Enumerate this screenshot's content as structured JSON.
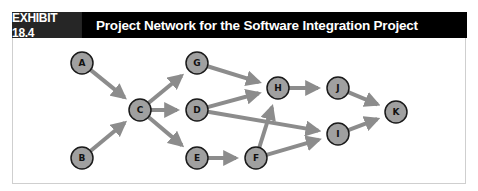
{
  "header": {
    "exhibit_label": "EXHIBIT 18.4",
    "title": "Project Network for the Software Integration Project"
  },
  "colors": {
    "header_bg": "#000000",
    "exhibit_bg": "#262626",
    "node_fill": "#a0a0a0",
    "node_stroke": "#1a1a1a",
    "arrow": "#8c8c8c"
  },
  "diagram": {
    "type": "activity-on-node project network",
    "nodes": [
      {
        "id": "A",
        "label": "A",
        "x": 82,
        "y": 63
      },
      {
        "id": "B",
        "label": "B",
        "x": 82,
        "y": 158
      },
      {
        "id": "C",
        "label": "C",
        "x": 140,
        "y": 110
      },
      {
        "id": "G",
        "label": "G",
        "x": 197,
        "y": 63
      },
      {
        "id": "D",
        "label": "D",
        "x": 197,
        "y": 110
      },
      {
        "id": "E",
        "label": "E",
        "x": 197,
        "y": 158
      },
      {
        "id": "F",
        "label": "F",
        "x": 256,
        "y": 158
      },
      {
        "id": "H",
        "label": "H",
        "x": 278,
        "y": 88
      },
      {
        "id": "J",
        "label": "J",
        "x": 338,
        "y": 88
      },
      {
        "id": "I",
        "label": "I",
        "x": 338,
        "y": 134
      },
      {
        "id": "K",
        "label": "K",
        "x": 396,
        "y": 112
      }
    ],
    "edges": [
      {
        "from": "A",
        "to": "C"
      },
      {
        "from": "B",
        "to": "C"
      },
      {
        "from": "C",
        "to": "G"
      },
      {
        "from": "C",
        "to": "D"
      },
      {
        "from": "C",
        "to": "E"
      },
      {
        "from": "G",
        "to": "H"
      },
      {
        "from": "D",
        "to": "H"
      },
      {
        "from": "D",
        "to": "I"
      },
      {
        "from": "E",
        "to": "F"
      },
      {
        "from": "F",
        "to": "H"
      },
      {
        "from": "F",
        "to": "I"
      },
      {
        "from": "H",
        "to": "J"
      },
      {
        "from": "J",
        "to": "K"
      },
      {
        "from": "I",
        "to": "K"
      }
    ]
  }
}
